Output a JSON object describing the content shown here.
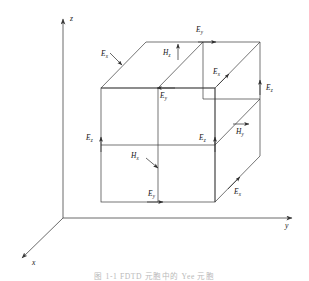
{
  "figure": {
    "title_caption": "图 1-1  FDTD 元胞中的 Yee 元胞",
    "axes": [
      {
        "name": "z-axis",
        "label": "z"
      },
      {
        "name": "y-axis",
        "label": "y"
      },
      {
        "name": "x-axis",
        "label": "x"
      }
    ],
    "line_color": "#3a3a3a",
    "label_color": "#141414",
    "caption_color": "#b9b9b9"
  },
  "labels": {
    "top_back_ey": {
      "sym": "E",
      "sub": "y"
    },
    "top_left_ex": {
      "sym": "E",
      "sub": "x"
    },
    "top_hz": {
      "sym": "H",
      "sub": "z"
    },
    "mid_top_ey": {
      "sym": "E",
      "sub": "y"
    },
    "right_upper_ex": {
      "sym": "E",
      "sub": "x"
    },
    "far_right_ez": {
      "sym": "E",
      "sub": "z"
    },
    "left_ez": {
      "sym": "E",
      "sub": "z"
    },
    "mid_right_ez": {
      "sym": "E",
      "sub": "z"
    },
    "right_hy": {
      "sym": "H",
      "sub": "y"
    },
    "center_hx": {
      "sym": "H",
      "sub": "x"
    },
    "bottom_ey": {
      "sym": "E",
      "sub": "y"
    },
    "bottom_right_ex": {
      "sym": "E",
      "sub": "x"
    }
  }
}
